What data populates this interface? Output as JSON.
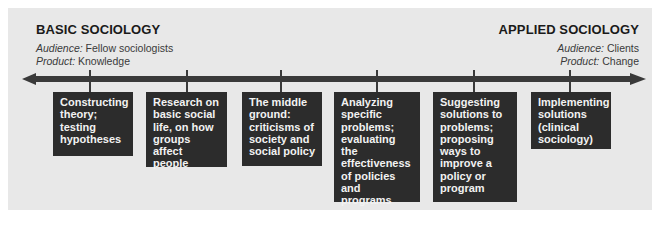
{
  "diagram": {
    "left_header": {
      "title": "BASIC SOCIOLOGY",
      "audience_label": "Audience:",
      "audience_value": " Fellow sociologists",
      "product_label": "Product:",
      "product_value": " Knowledge"
    },
    "right_header": {
      "title": "APPLIED SOCIOLOGY",
      "audience_label": "Audience:",
      "audience_value": " Clients",
      "product_label": "Product:",
      "product_value": " Change"
    },
    "axis": {
      "direction": "bidirectional",
      "color": "#3a3a3a"
    },
    "boxes": [
      {
        "text": "Constructing\ntheory;\ntesting\nhypotheses"
      },
      {
        "text": "Research on\nbasic social\nlife, on how\ngroups affect\npeople"
      },
      {
        "text": "The middle\nground:\ncriticisms of\nsociety and\nsocial policy"
      },
      {
        "text": "Analyzing\nspecific\nproblems;\nevaluating the\neffectiveness\nof policies and\nprograms"
      },
      {
        "text": "Suggesting\nsolutions to\nproblems;\nproposing\nways to\nimprove a\npolicy or\nprogram"
      },
      {
        "text": "Implementing\nsolutions\n   (clinical\n   sociology)"
      }
    ],
    "colors": {
      "background": "#e8e8e8",
      "box": "#2c2c2c",
      "box_text": "#f2f2f2"
    }
  }
}
